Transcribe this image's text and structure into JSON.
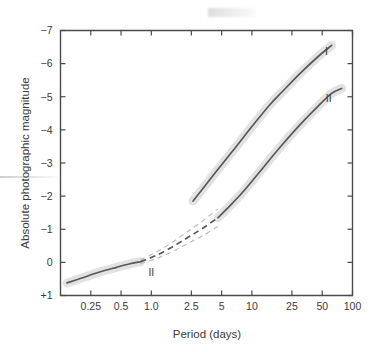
{
  "chart_data": {
    "type": "line",
    "title": "",
    "xlabel": "Period (days)",
    "ylabel": "Absolute photographic magnitude",
    "xscale": "log",
    "xlim": [
      0.125,
      100
    ],
    "ylim": [
      1,
      -7
    ],
    "y_inverted": true,
    "grid": false,
    "legend": "inline-annotations",
    "xticklabels": [
      "0.25",
      "0.5",
      "1.0",
      "2.5",
      "5",
      "10",
      "25",
      "50",
      "100"
    ],
    "xtickvalues": [
      0.25,
      0.5,
      1.0,
      2.5,
      5,
      10,
      25,
      50,
      100
    ],
    "yticklabels": [
      "−7",
      "−6",
      "−5",
      "−4",
      "−3",
      "−2",
      "−1",
      "0",
      "+1"
    ],
    "ytickvalues": [
      -7,
      -6,
      -5,
      -4,
      -3,
      -2,
      -1,
      0,
      1
    ],
    "series": [
      {
        "name": "I",
        "label": "I",
        "style": "solid-with-band",
        "points": [
          {
            "x": 2.6,
            "y": -1.85
          },
          {
            "x": 3.5,
            "y": -2.35
          },
          {
            "x": 5.0,
            "y": -2.95
          },
          {
            "x": 7.0,
            "y": -3.5
          },
          {
            "x": 10.0,
            "y": -4.1
          },
          {
            "x": 15.0,
            "y": -4.75
          },
          {
            "x": 20.0,
            "y": -5.15
          },
          {
            "x": 30.0,
            "y": -5.7
          },
          {
            "x": 45.0,
            "y": -6.2
          },
          {
            "x": 62.0,
            "y": -6.55
          }
        ]
      },
      {
        "name": "II-upper",
        "label": "II",
        "style": "solid-with-band",
        "points": [
          {
            "x": 4.6,
            "y": -1.35
          },
          {
            "x": 6.0,
            "y": -1.7
          },
          {
            "x": 8.0,
            "y": -2.1
          },
          {
            "x": 11.0,
            "y": -2.6
          },
          {
            "x": 15.0,
            "y": -3.1
          },
          {
            "x": 20.0,
            "y": -3.55
          },
          {
            "x": 30.0,
            "y": -4.15
          },
          {
            "x": 45.0,
            "y": -4.7
          },
          {
            "x": 62.0,
            "y": -5.1
          },
          {
            "x": 78.0,
            "y": -5.25
          }
        ]
      },
      {
        "name": "II-lower",
        "label": "II",
        "style": "solid-with-band",
        "points": [
          {
            "x": 0.145,
            "y": 0.62
          },
          {
            "x": 0.2,
            "y": 0.48
          },
          {
            "x": 0.3,
            "y": 0.3
          },
          {
            "x": 0.45,
            "y": 0.15
          },
          {
            "x": 0.6,
            "y": 0.05
          },
          {
            "x": 0.78,
            "y": -0.02
          }
        ]
      },
      {
        "name": "II-dashed-extrapolation",
        "label": "",
        "style": "dashed-with-envelope",
        "points": [
          {
            "x": 0.78,
            "y": -0.02
          },
          {
            "x": 1.1,
            "y": -0.2
          },
          {
            "x": 1.6,
            "y": -0.46
          },
          {
            "x": 2.3,
            "y": -0.75
          },
          {
            "x": 3.2,
            "y": -1.02
          },
          {
            "x": 4.6,
            "y": -1.35
          }
        ]
      }
    ],
    "annotations": [
      {
        "text": "I",
        "x": 55.0,
        "y": -6.25,
        "series": "I"
      },
      {
        "text": "II",
        "x": 58.0,
        "y": -4.85,
        "series": "II-upper"
      },
      {
        "text": "II",
        "x": 1.0,
        "y": 0.42,
        "series": "II-dashed-extrapolation"
      }
    ],
    "band_color": "#e2e2e2",
    "line_color": "#585858",
    "axis_color": "#4a4a4a",
    "background": "#ffffff"
  }
}
